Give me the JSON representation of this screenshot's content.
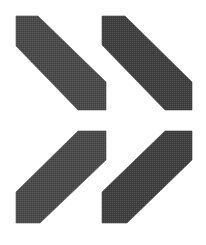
{
  "figure": {
    "width": 206,
    "height": 245,
    "background": "#ffffff",
    "shapes": [
      {
        "name": "top-left-bar",
        "direction": "descending-diagonal",
        "fill": "#4a4a4a",
        "points": "16,16 38,16 106,82 106,110 78,110 16,46"
      },
      {
        "name": "top-right-bar",
        "direction": "descending-diagonal",
        "fill": "#3f3f3f",
        "points": "102,16 125,16 192,82 192,110 165,110 102,45"
      },
      {
        "name": "bottom-left-bar",
        "direction": "ascending-diagonal",
        "fill": "#4a4a4a",
        "points": "78,131 106,131 106,160 40,223 16,223 16,192"
      },
      {
        "name": "bottom-right-bar",
        "direction": "ascending-diagonal",
        "fill": "#3f3f3f",
        "points": "165,131 192,131 192,160 127,223 102,223 102,192"
      }
    ]
  }
}
